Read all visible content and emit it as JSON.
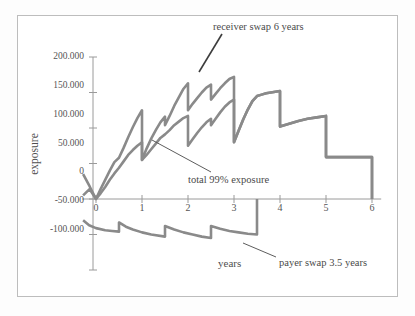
{
  "figure": {
    "background": "#ffffff",
    "frame_color": "#bdbdbd",
    "curve_color": "#8a8a8a",
    "axis_color": "#9a9a9a",
    "text_color": "#4a4a4a"
  },
  "axes": {
    "y_title": "exposure",
    "x_title": "years",
    "y_ticks": [
      "200.000",
      "150.000",
      "100.000",
      "50.000",
      "0",
      "-50.000",
      "-100.000"
    ],
    "x_ticks": [
      "0",
      "1",
      "2",
      "3",
      "4",
      "5",
      "6"
    ]
  },
  "annotations": [
    {
      "id": "receiver",
      "text": "receiver swap 6 years"
    },
    {
      "id": "total",
      "text": "total 99% exposure"
    },
    {
      "id": "payer",
      "text": "payer swap 3.5 years"
    }
  ],
  "chart_data": {
    "type": "line",
    "title": "",
    "subtitle": "",
    "xlabel": "years",
    "ylabel": "exposure",
    "xlim": [
      -0.4,
      6.3
    ],
    "ylim": [
      -100,
      200
    ],
    "y_tick_values": [
      200,
      150,
      100,
      50,
      0,
      -50,
      -100
    ],
    "y_tick_labels": [
      "200.000",
      "150.000",
      "100.000",
      "50.000",
      "0",
      "-50.000",
      "-100.000"
    ],
    "x_tick_values": [
      0,
      1,
      2,
      3,
      4,
      5,
      6
    ],
    "x_tick_labels": [
      "0",
      "1",
      "2",
      "3",
      "4",
      "5",
      "6"
    ],
    "grid": false,
    "legend": "annotations-with-leader-lines",
    "note": "Counterparty credit exposure profiles: sawtooth resets at semi-annual swap payment dates.",
    "series": [
      {
        "name": "receiver swap 6 years",
        "color": "#8a8a8a",
        "points": [
          [
            -0.28,
            35
          ],
          [
            -0.14,
            18
          ],
          [
            0.0,
            0
          ],
          [
            0.1,
            14
          ],
          [
            0.2,
            27
          ],
          [
            0.3,
            40
          ],
          [
            0.4,
            52
          ],
          [
            0.5,
            58
          ],
          [
            0.5,
            58
          ],
          [
            0.6,
            72
          ],
          [
            0.7,
            87
          ],
          [
            0.8,
            101
          ],
          [
            0.9,
            114
          ],
          [
            1.0,
            125
          ],
          [
            1.0,
            55
          ],
          [
            1.1,
            71
          ],
          [
            1.2,
            85
          ],
          [
            1.3,
            97
          ],
          [
            1.4,
            108
          ],
          [
            1.5,
            116
          ],
          [
            1.5,
            104
          ],
          [
            1.6,
            117
          ],
          [
            1.7,
            131
          ],
          [
            1.8,
            143
          ],
          [
            1.9,
            155
          ],
          [
            2.0,
            163
          ],
          [
            2.0,
            125
          ],
          [
            2.1,
            134
          ],
          [
            2.2,
            142
          ],
          [
            2.3,
            150
          ],
          [
            2.4,
            157
          ],
          [
            2.5,
            161
          ],
          [
            2.5,
            140
          ],
          [
            2.6,
            148
          ],
          [
            2.7,
            156
          ],
          [
            2.8,
            163
          ],
          [
            2.9,
            169
          ],
          [
            3.0,
            172
          ],
          [
            3.0,
            80
          ],
          [
            3.1,
            96
          ],
          [
            3.2,
            112
          ],
          [
            3.3,
            126
          ],
          [
            3.4,
            138
          ],
          [
            3.5,
            145
          ],
          [
            3.5,
            145
          ],
          [
            3.6,
            147
          ],
          [
            3.7,
            149
          ],
          [
            3.8,
            150
          ],
          [
            3.9,
            151
          ],
          [
            4.0,
            152
          ],
          [
            4.0,
            102
          ],
          [
            4.2,
            106
          ],
          [
            4.4,
            110
          ],
          [
            4.6,
            113
          ],
          [
            4.8,
            115
          ],
          [
            5.0,
            117
          ],
          [
            5.0,
            59
          ],
          [
            5.5,
            59
          ],
          [
            6.0,
            59
          ],
          [
            6.0,
            0
          ]
        ]
      },
      {
        "name": "total 99% exposure",
        "color": "#8a8a8a",
        "points": [
          [
            -0.28,
            5
          ],
          [
            -0.14,
            14
          ],
          [
            0.0,
            0
          ],
          [
            0.1,
            8
          ],
          [
            0.2,
            17
          ],
          [
            0.3,
            27
          ],
          [
            0.4,
            36
          ],
          [
            0.5,
            44
          ],
          [
            0.5,
            44
          ],
          [
            0.6,
            53
          ],
          [
            0.7,
            62
          ],
          [
            0.8,
            69
          ],
          [
            0.9,
            75
          ],
          [
            1.0,
            80
          ],
          [
            1.0,
            55
          ],
          [
            1.1,
            62
          ],
          [
            1.2,
            70
          ],
          [
            1.3,
            78
          ],
          [
            1.4,
            86
          ],
          [
            1.5,
            91
          ],
          [
            1.5,
            91
          ],
          [
            1.6,
            97
          ],
          [
            1.7,
            104
          ],
          [
            1.8,
            109
          ],
          [
            1.9,
            114
          ],
          [
            2.0,
            117
          ],
          [
            2.0,
            75
          ],
          [
            2.1,
            84
          ],
          [
            2.2,
            93
          ],
          [
            2.3,
            101
          ],
          [
            2.4,
            108
          ],
          [
            2.5,
            113
          ],
          [
            2.5,
            104
          ],
          [
            2.6,
            113
          ],
          [
            2.7,
            122
          ],
          [
            2.8,
            130
          ],
          [
            2.9,
            136
          ],
          [
            3.0,
            140
          ],
          [
            3.0,
            80
          ],
          [
            3.1,
            96
          ],
          [
            3.2,
            112
          ],
          [
            3.3,
            126
          ],
          [
            3.4,
            138
          ],
          [
            3.5,
            145
          ],
          [
            3.5,
            145
          ],
          [
            3.6,
            147
          ],
          [
            3.7,
            149
          ],
          [
            3.8,
            150
          ],
          [
            3.9,
            151
          ],
          [
            4.0,
            152
          ],
          [
            4.0,
            102
          ],
          [
            4.2,
            106
          ],
          [
            4.4,
            110
          ],
          [
            4.6,
            113
          ],
          [
            4.8,
            115
          ],
          [
            5.0,
            117
          ],
          [
            5.0,
            59
          ],
          [
            5.5,
            59
          ],
          [
            6.0,
            59
          ],
          [
            6.0,
            0
          ]
        ]
      },
      {
        "name": "payer swap 3.5 years",
        "color": "#8a8a8a",
        "points": [
          [
            -0.28,
            -30
          ],
          [
            -0.15,
            -37
          ],
          [
            0.0,
            -41
          ],
          [
            0.2,
            -44
          ],
          [
            0.35,
            -45
          ],
          [
            0.5,
            -46
          ],
          [
            0.5,
            -33
          ],
          [
            0.65,
            -39
          ],
          [
            0.8,
            -43
          ],
          [
            1.0,
            -47
          ],
          [
            1.2,
            -50
          ],
          [
            1.5,
            -53
          ],
          [
            1.5,
            -38
          ],
          [
            1.7,
            -43
          ],
          [
            1.9,
            -47
          ],
          [
            2.1,
            -50
          ],
          [
            2.3,
            -53
          ],
          [
            2.5,
            -55
          ],
          [
            2.5,
            -38
          ],
          [
            2.7,
            -42
          ],
          [
            2.9,
            -45
          ],
          [
            3.1,
            -47
          ],
          [
            3.3,
            -49
          ],
          [
            3.5,
            -50
          ],
          [
            3.5,
            0
          ]
        ]
      }
    ]
  }
}
